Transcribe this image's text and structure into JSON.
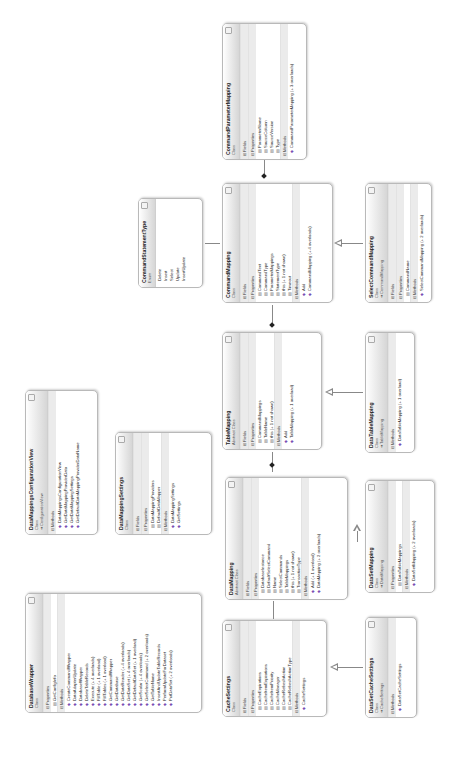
{
  "boxes": {
    "commandParameterMapping": {
      "title": "CommandParameterMapping",
      "kind": "Class",
      "base": "",
      "sections": [
        {
          "label": "Fields",
          "collapsed": true,
          "items": []
        },
        {
          "label": "Properties",
          "collapsed": false,
          "items": [
            "ParameterName",
            "SourceColumn",
            "SourceVersion",
            "Type"
          ]
        },
        {
          "label": "Methods",
          "collapsed": false,
          "items": [
            "CommandParameterMapping (+ 3 overloads)"
          ]
        }
      ]
    },
    "commandStatementType": {
      "title": "CommandStatementType",
      "kind": "Enum",
      "values": [
        "Delete",
        "Insert",
        "Select",
        "Update",
        "InsertUpdate"
      ]
    },
    "commandMapping": {
      "title": "CommandMapping",
      "kind": "Class",
      "base": "",
      "sections": [
        {
          "label": "Fields",
          "collapsed": true,
          "items": []
        },
        {
          "label": "Properties",
          "collapsed": false,
          "items": [
            "CommandText",
            "CommandType",
            "ParameterMappings",
            "StatementType",
            "this (+ 1 not shown)",
            "Timeout"
          ]
        },
        {
          "label": "Methods",
          "collapsed": false,
          "items": [
            "Add",
            "CommandMapping (+ 4 overloads)"
          ]
        }
      ]
    },
    "selectCommandMapping": {
      "title": "SelectCommandMapping",
      "kind": "Class",
      "base": "CommandMapping",
      "sections": [
        {
          "label": "Fields",
          "collapsed": true,
          "items": []
        },
        {
          "label": "Properties",
          "collapsed": false,
          "items": [
            "CommandName"
          ]
        },
        {
          "label": "Methods",
          "collapsed": false,
          "items": [
            "SelectCommandMapping (+ 2 overloads)"
          ]
        }
      ]
    },
    "tableMapping": {
      "title": "TableMapping",
      "kind": "Abstract Class",
      "base": "",
      "sections": [
        {
          "label": "Fields",
          "collapsed": true,
          "items": []
        },
        {
          "label": "Properties",
          "collapsed": false,
          "items": [
            "CommandMappings",
            "TableName",
            "this (+ 1 not shown)"
          ]
        },
        {
          "label": "Methods",
          "collapsed": false,
          "items": [
            "Add",
            "TableMapping (+ 1 overload)"
          ]
        }
      ]
    },
    "dataTableMapping": {
      "title": "DataTableMapping",
      "kind": "Class",
      "base": "TableMapping",
      "sections": [
        {
          "label": "Methods",
          "collapsed": false,
          "items": [
            "DataTableMapping (+ 1 overload)"
          ]
        }
      ]
    },
    "dataMappingConfigurationView": {
      "title": "DataMappingsConfigurationView",
      "kind": "Class",
      "base": "ConfigurationView",
      "sections": [
        {
          "label": "Methods",
          "collapsed": false,
          "items": [
            "DataMappingsConfigurationView",
            "GetDataMappingProviderData",
            "GetDataMappingSettings",
            "GetDefaultDataMappingProviderDataName"
          ]
        }
      ]
    },
    "dataMappingSettings": {
      "title": "DataMappingSettings",
      "kind": "Class",
      "base": "",
      "sections": [
        {
          "label": "Fields",
          "collapsed": true,
          "items": []
        },
        {
          "label": "Properties",
          "collapsed": false,
          "items": [
            "DataMappingProviders",
            "DefaultDataMapper"
          ]
        },
        {
          "label": "Methods",
          "collapsed": false,
          "items": [
            "DataMappingSettings",
            "GetSettings"
          ]
        }
      ]
    },
    "dataMapping": {
      "title": "DataMapping",
      "kind": "Abstract Class",
      "base": "",
      "sections": [
        {
          "label": "Fields",
          "collapsed": true,
          "items": []
        },
        {
          "label": "Properties",
          "collapsed": false,
          "items": [
            "DatabaseInstance",
            "DefaultSelectCommand",
            "Name",
            "SelectCommands",
            "TableMappings",
            "this (+ 1 not shown)",
            "TransactionType"
          ]
        },
        {
          "label": "Methods",
          "collapsed": false,
          "items": [
            "Add (+ 1 overload)",
            "DataMapping (+ 2 overloads)"
          ]
        }
      ]
    },
    "dataSetMapping": {
      "title": "DataSetMapping",
      "kind": "Class",
      "base": "DataMapping",
      "sections": [
        {
          "label": "Properties",
          "collapsed": false,
          "items": [
            "DataTableMappings"
          ]
        },
        {
          "label": "Methods",
          "collapsed": false,
          "items": [
            "DataSetMapping (+ 2 overloads)"
          ]
        }
      ]
    },
    "databaseWrapper": {
      "title": "DatabaseWrapper",
      "kind": "Class",
      "base": "",
      "sections": [
        {
          "label": "Properties",
          "collapsed": false,
          "items": [
            "GetConfigInfo"
          ]
        },
        {
          "label": "Methods",
          "collapsed": false,
          "items": [
            "CreateCommandWrapper",
            "DataAdapterUpdate",
            "DatabaseWrapper",
            "DeleteTableRecords",
            "Execute (+ 4 overloads)",
            "FillTable (+ 1 overload)",
            "FillTables (+ 1 overload)",
            "GetCommandWrapper",
            "GetDatabase",
            "GetDataReader (+ 4 overloads)",
            "GetDataSet (+ 4 overloads)",
            "GetDefaultDataSet (+ 1 overload)",
            "GetScalar (+ 4 overloads)",
            "GetSelectCommand (+ 2 overloads)",
            "GetTableName",
            "InsertAndUpdateTableRecords",
            "PerformUpdateForDataset",
            "PutDataSet (+ 2 overloads)"
          ]
        }
      ]
    },
    "cacheSettings": {
      "title": "CacheSettings",
      "kind": "Class",
      "base": "",
      "sections": [
        {
          "label": "Fields",
          "collapsed": true,
          "items": []
        },
        {
          "label": "Properties",
          "collapsed": false,
          "items": [
            "CacheExpirations",
            "CacheItemExpirations",
            "CacheItemPriority",
            "CacheManager",
            "CacheRefreshAction",
            "CacheRefreshActionType"
          ]
        },
        {
          "label": "Methods",
          "collapsed": false,
          "items": [
            "CacheSettings"
          ]
        }
      ]
    },
    "dataSetCacheSettings": {
      "title": "DataSetCacheSettings",
      "kind": "Class",
      "base": "CacheSettings",
      "sections": [
        {
          "label": "Methods",
          "collapsed": false,
          "items": [
            "DataSetCacheSettings"
          ]
        }
      ]
    }
  }
}
